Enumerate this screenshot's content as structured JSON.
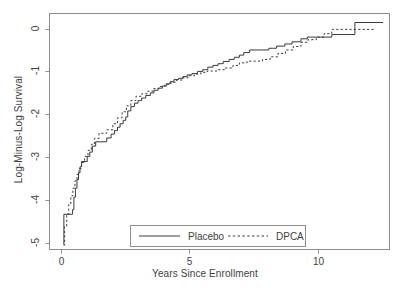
{
  "chart_data": {
    "type": "line",
    "title": "",
    "subtitle": "",
    "xlabel": "Years Since Enrollment",
    "ylabel": "Log-Minus-Log Survival",
    "xlim": [
      -0.45,
      12.8
    ],
    "ylim": [
      -5.15,
      0.35
    ],
    "xticks": [
      0,
      5,
      10
    ],
    "xtick_labels": [
      "0",
      "5",
      "10"
    ],
    "yticks": [
      0,
      -1,
      -2,
      -3,
      -4,
      -5
    ],
    "ytick_labels": [
      "0",
      "-1",
      "-2",
      "-3",
      "-4",
      "-5"
    ],
    "grid": false,
    "step_shape": "hv",
    "legend": {
      "position": "bottom-center",
      "boxed": true,
      "entries": [
        {
          "label": "Placebo",
          "style": "solid",
          "color": "#3a3a3a"
        },
        {
          "label": "DPCA",
          "style": "dotted",
          "color": "#3a3a3a"
        }
      ]
    },
    "series": [
      {
        "name": "Placebo",
        "style": "solid",
        "color": "#3a3a3a",
        "points": [
          [
            0.08,
            -5.02
          ],
          [
            0.11,
            -5.02
          ],
          [
            0.11,
            -4.33
          ],
          [
            0.45,
            -4.33
          ],
          [
            0.45,
            -4.22
          ],
          [
            0.5,
            -4.22
          ],
          [
            0.5,
            -3.93
          ],
          [
            0.56,
            -3.93
          ],
          [
            0.56,
            -3.72
          ],
          [
            0.62,
            -3.72
          ],
          [
            0.62,
            -3.52
          ],
          [
            0.68,
            -3.52
          ],
          [
            0.68,
            -3.36
          ],
          [
            0.74,
            -3.36
          ],
          [
            0.74,
            -3.22
          ],
          [
            0.8,
            -3.22
          ],
          [
            0.8,
            -3.1
          ],
          [
            1.02,
            -3.1
          ],
          [
            1.02,
            -2.98
          ],
          [
            1.12,
            -2.98
          ],
          [
            1.12,
            -2.88
          ],
          [
            1.22,
            -2.88
          ],
          [
            1.22,
            -2.74
          ],
          [
            1.35,
            -2.74
          ],
          [
            1.35,
            -2.64
          ],
          [
            1.78,
            -2.64
          ],
          [
            1.78,
            -2.55
          ],
          [
            1.95,
            -2.55
          ],
          [
            1.95,
            -2.46
          ],
          [
            2.08,
            -2.46
          ],
          [
            2.08,
            -2.38
          ],
          [
            2.2,
            -2.38
          ],
          [
            2.2,
            -2.3
          ],
          [
            2.3,
            -2.3
          ],
          [
            2.3,
            -2.22
          ],
          [
            2.42,
            -2.22
          ],
          [
            2.42,
            -2.14
          ],
          [
            2.52,
            -2.14
          ],
          [
            2.52,
            -2.06
          ],
          [
            2.6,
            -2.06
          ],
          [
            2.6,
            -1.92
          ],
          [
            2.72,
            -1.92
          ],
          [
            2.72,
            -1.82
          ],
          [
            2.86,
            -1.82
          ],
          [
            2.86,
            -1.74
          ],
          [
            3.0,
            -1.74
          ],
          [
            3.0,
            -1.68
          ],
          [
            3.14,
            -1.68
          ],
          [
            3.14,
            -1.62
          ],
          [
            3.3,
            -1.62
          ],
          [
            3.3,
            -1.56
          ],
          [
            3.48,
            -1.56
          ],
          [
            3.48,
            -1.5
          ],
          [
            3.62,
            -1.5
          ],
          [
            3.62,
            -1.44
          ],
          [
            3.78,
            -1.44
          ],
          [
            3.78,
            -1.39
          ],
          [
            3.95,
            -1.39
          ],
          [
            3.95,
            -1.34
          ],
          [
            4.1,
            -1.34
          ],
          [
            4.1,
            -1.29
          ],
          [
            4.25,
            -1.29
          ],
          [
            4.25,
            -1.24
          ],
          [
            4.4,
            -1.24
          ],
          [
            4.4,
            -1.19
          ],
          [
            4.58,
            -1.19
          ],
          [
            4.58,
            -1.16
          ],
          [
            4.75,
            -1.16
          ],
          [
            4.75,
            -1.12
          ],
          [
            4.92,
            -1.12
          ],
          [
            4.92,
            -1.08
          ],
          [
            5.1,
            -1.08
          ],
          [
            5.1,
            -1.05
          ],
          [
            5.32,
            -1.05
          ],
          [
            5.32,
            -1.0
          ],
          [
            5.52,
            -1.0
          ],
          [
            5.52,
            -0.96
          ],
          [
            5.72,
            -0.96
          ],
          [
            5.72,
            -0.9
          ],
          [
            5.92,
            -0.9
          ],
          [
            5.92,
            -0.86
          ],
          [
            6.12,
            -0.86
          ],
          [
            6.12,
            -0.82
          ],
          [
            6.32,
            -0.82
          ],
          [
            6.32,
            -0.77
          ],
          [
            6.55,
            -0.77
          ],
          [
            6.55,
            -0.72
          ],
          [
            6.75,
            -0.72
          ],
          [
            6.75,
            -0.67
          ],
          [
            6.95,
            -0.67
          ],
          [
            6.95,
            -0.62
          ],
          [
            7.12,
            -0.62
          ],
          [
            7.12,
            -0.56
          ],
          [
            7.35,
            -0.56
          ],
          [
            7.35,
            -0.5
          ],
          [
            8.1,
            -0.5
          ],
          [
            8.1,
            -0.46
          ],
          [
            8.4,
            -0.46
          ],
          [
            8.4,
            -0.41
          ],
          [
            8.72,
            -0.41
          ],
          [
            8.72,
            -0.36
          ],
          [
            9.0,
            -0.36
          ],
          [
            9.0,
            -0.31
          ],
          [
            9.35,
            -0.31
          ],
          [
            9.35,
            -0.24
          ],
          [
            9.6,
            -0.24
          ],
          [
            9.6,
            -0.2
          ],
          [
            10.55,
            -0.2
          ],
          [
            10.55,
            -0.14
          ],
          [
            11.45,
            -0.14
          ],
          [
            11.45,
            0.14
          ],
          [
            12.55,
            0.14
          ]
        ]
      },
      {
        "name": "DPCA",
        "style": "dotted",
        "color": "#3a3a3a",
        "points": [
          [
            0.1,
            -5.05
          ],
          [
            0.14,
            -5.05
          ],
          [
            0.14,
            -4.62
          ],
          [
            0.22,
            -4.62
          ],
          [
            0.22,
            -4.32
          ],
          [
            0.3,
            -4.32
          ],
          [
            0.3,
            -4.1
          ],
          [
            0.38,
            -4.1
          ],
          [
            0.38,
            -3.9
          ],
          [
            0.46,
            -3.9
          ],
          [
            0.46,
            -3.72
          ],
          [
            0.54,
            -3.72
          ],
          [
            0.54,
            -3.55
          ],
          [
            0.62,
            -3.55
          ],
          [
            0.62,
            -3.4
          ],
          [
            0.7,
            -3.4
          ],
          [
            0.7,
            -3.26
          ],
          [
            0.8,
            -3.26
          ],
          [
            0.8,
            -3.12
          ],
          [
            0.92,
            -3.12
          ],
          [
            0.92,
            -2.98
          ],
          [
            1.05,
            -2.98
          ],
          [
            1.05,
            -2.84
          ],
          [
            1.18,
            -2.84
          ],
          [
            1.18,
            -2.7
          ],
          [
            1.3,
            -2.7
          ],
          [
            1.3,
            -2.56
          ],
          [
            1.48,
            -2.56
          ],
          [
            1.48,
            -2.44
          ],
          [
            1.78,
            -2.44
          ],
          [
            1.78,
            -2.36
          ],
          [
            2.02,
            -2.36
          ],
          [
            2.02,
            -2.22
          ],
          [
            2.2,
            -2.22
          ],
          [
            2.2,
            -2.08
          ],
          [
            2.38,
            -2.08
          ],
          [
            2.38,
            -1.94
          ],
          [
            2.55,
            -1.94
          ],
          [
            2.55,
            -1.8
          ],
          [
            2.72,
            -1.8
          ],
          [
            2.72,
            -1.68
          ],
          [
            2.92,
            -1.68
          ],
          [
            2.92,
            -1.58
          ],
          [
            3.15,
            -1.58
          ],
          [
            3.15,
            -1.52
          ],
          [
            3.38,
            -1.52
          ],
          [
            3.38,
            -1.46
          ],
          [
            3.6,
            -1.46
          ],
          [
            3.6,
            -1.4
          ],
          [
            3.82,
            -1.4
          ],
          [
            3.82,
            -1.35
          ],
          [
            4.05,
            -1.35
          ],
          [
            4.05,
            -1.3
          ],
          [
            4.28,
            -1.3
          ],
          [
            4.28,
            -1.25
          ],
          [
            4.5,
            -1.25
          ],
          [
            4.5,
            -1.2
          ],
          [
            4.72,
            -1.2
          ],
          [
            4.72,
            -1.15
          ],
          [
            4.95,
            -1.15
          ],
          [
            4.95,
            -1.1
          ],
          [
            5.2,
            -1.1
          ],
          [
            5.2,
            -1.06
          ],
          [
            5.45,
            -1.06
          ],
          [
            5.45,
            -1.02
          ],
          [
            5.7,
            -1.02
          ],
          [
            5.7,
            -0.99
          ],
          [
            6.1,
            -0.99
          ],
          [
            6.1,
            -0.96
          ],
          [
            6.4,
            -0.96
          ],
          [
            6.4,
            -0.92
          ],
          [
            6.7,
            -0.92
          ],
          [
            6.7,
            -0.86
          ],
          [
            6.95,
            -0.86
          ],
          [
            6.95,
            -0.8
          ],
          [
            7.25,
            -0.8
          ],
          [
            7.25,
            -0.76
          ],
          [
            7.85,
            -0.76
          ],
          [
            7.85,
            -0.72
          ],
          [
            8.15,
            -0.72
          ],
          [
            8.15,
            -0.66
          ],
          [
            8.45,
            -0.66
          ],
          [
            8.45,
            -0.58
          ],
          [
            8.75,
            -0.58
          ],
          [
            8.75,
            -0.5
          ],
          [
            9.05,
            -0.5
          ],
          [
            9.05,
            -0.42
          ],
          [
            9.35,
            -0.42
          ],
          [
            9.35,
            -0.32
          ],
          [
            9.62,
            -0.32
          ],
          [
            9.62,
            -0.26
          ],
          [
            9.95,
            -0.26
          ],
          [
            9.95,
            -0.2
          ],
          [
            10.25,
            -0.2
          ],
          [
            10.25,
            -0.12
          ],
          [
            10.55,
            -0.12
          ],
          [
            10.55,
            -0.02
          ],
          [
            12.2,
            -0.02
          ]
        ]
      }
    ]
  },
  "axes": {
    "x_title": "Years Since Enrollment",
    "y_title": "Log-Minus-Log Survival",
    "x_tick_labels": [
      "0",
      "5",
      "10"
    ],
    "y_tick_labels": [
      "0",
      "-1",
      "-2",
      "-3",
      "-4",
      "-5"
    ]
  },
  "legend": {
    "placebo_label": "Placebo",
    "dpca_label": "DPCA"
  },
  "colors": {
    "line": "#3a3a3a",
    "frame": "#8e8e8e",
    "text": "#3e3e3e",
    "background": "#ffffff"
  }
}
